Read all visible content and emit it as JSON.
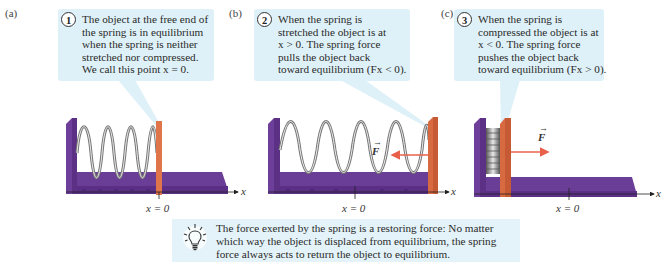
{
  "panels": [
    {
      "id": "a",
      "label": "(a)",
      "step": "1",
      "text_lines": [
        "The object at the free end of",
        "the spring is in equilibrium",
        "when the spring is neither",
        "stretched nor compressed.",
        "We call this point x = 0."
      ],
      "state": "equilibrium",
      "axis_label": "x",
      "origin_label": "x = 0"
    },
    {
      "id": "b",
      "label": "(b)",
      "step": "2",
      "text_lines": [
        "When the spring is",
        "stretched the object is at",
        "x > 0. The spring force",
        "pulls the object back",
        "toward equilibrium (Fx < 0)."
      ],
      "state": "stretched",
      "force_label": "F",
      "force_direction": "left",
      "axis_label": "x",
      "origin_label": "x = 0"
    },
    {
      "id": "c",
      "label": "(c)",
      "step": "3",
      "text_lines": [
        "When the spring is",
        "compressed the object is at",
        "x < 0. The spring force",
        "pushes the object back",
        "toward equilibrium (Fx > 0)."
      ],
      "state": "compressed",
      "force_label": "F",
      "force_direction": "right",
      "axis_label": "x",
      "origin_label": "x = 0"
    }
  ],
  "note": {
    "icon": "lightbulb-icon",
    "lines": [
      "The force exerted by the spring is a restoring force: No matter",
      "which way the object is displaced from equilibrium, the spring",
      "force always acts to return the object to equilibrium."
    ]
  },
  "colors": {
    "callout_bg": "#dff1f8",
    "note_bg": "#e4f3f9",
    "apparatus_purple": "#6a3d96",
    "block_orange": "#e0744a",
    "force_arrow": "#e8604a",
    "spring_gray": "#8a8a8a"
  }
}
